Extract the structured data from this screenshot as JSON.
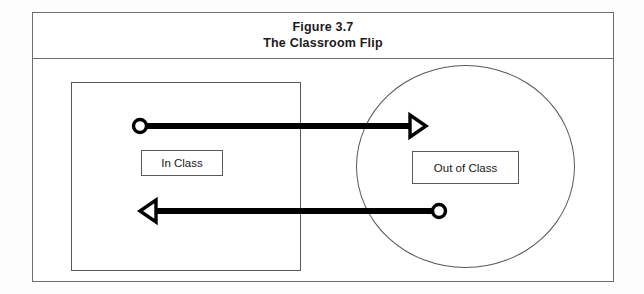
{
  "figure": {
    "title_line1": "Figure 3.7",
    "title_line2": "The Classroom Flip",
    "border_color": "#6d6d6d",
    "background_color": "#ffffff"
  },
  "diagram": {
    "type": "concept-diagram",
    "regions": [
      {
        "id": "in-class",
        "shape": "rectangle",
        "label": "In Class",
        "stroke_color": "#595959"
      },
      {
        "id": "out-of-class",
        "shape": "circle",
        "label": "Out of Class",
        "stroke_color": "#595959"
      }
    ],
    "arrows": [
      {
        "id": "in-to-out",
        "direction": "right",
        "from": "in-class",
        "to": "out-of-class",
        "tail": "circle",
        "head": "triangle",
        "color": "#000000"
      },
      {
        "id": "out-to-in",
        "direction": "left",
        "from": "out-of-class",
        "to": "in-class",
        "tail": "circle",
        "head": "triangle",
        "color": "#000000"
      }
    ]
  }
}
